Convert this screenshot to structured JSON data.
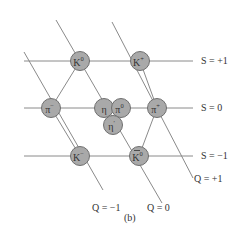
{
  "figure": {
    "caption": "(b)",
    "colors": {
      "line": "#8a8a8a",
      "node_fill": "#a9a9a9",
      "node_stroke": "#6f6f6f",
      "text": "#333333"
    }
  },
  "strangeness_lines": [
    {
      "label": "S = +1",
      "y": 61,
      "x1": 24,
      "x2": 193
    },
    {
      "label": "S = 0",
      "y": 108,
      "x1": 24,
      "x2": 193
    },
    {
      "label": "S = −1",
      "y": 156,
      "x1": 24,
      "x2": 193
    }
  ],
  "charge_lines": [
    {
      "label": "Q = −1",
      "x1": 24,
      "y1": 52,
      "x2": 103,
      "y2": 190
    },
    {
      "label": "Q = 0",
      "x1": 56,
      "y1": 20,
      "x2": 162,
      "y2": 203
    },
    {
      "label": "Q = +1",
      "x1": 112,
      "y1": 22,
      "x2": 193,
      "y2": 178
    }
  ],
  "edges": [
    {
      "x1": 80,
      "y1": 61,
      "x2": 51,
      "y2": 108
    },
    {
      "x1": 140,
      "y1": 61,
      "x2": 157,
      "y2": 108
    },
    {
      "x1": 51,
      "y1": 108,
      "x2": 80,
      "y2": 156
    },
    {
      "x1": 157,
      "y1": 108,
      "x2": 139,
      "y2": 156
    }
  ],
  "particles": [
    {
      "symbol": "K",
      "sup": "0",
      "overbar": false,
      "x": 80,
      "y": 61
    },
    {
      "symbol": "K",
      "sup": "+",
      "overbar": false,
      "x": 140,
      "y": 61
    },
    {
      "symbol": "π",
      "sup": "−",
      "overbar": false,
      "x": 51,
      "y": 108
    },
    {
      "symbol": "η",
      "sup": "",
      "overbar": false,
      "x": 104,
      "y": 108
    },
    {
      "symbol": "π",
      "sup": "0",
      "overbar": false,
      "x": 121,
      "y": 108
    },
    {
      "symbol": "π",
      "sup": "+",
      "overbar": false,
      "x": 157,
      "y": 108
    },
    {
      "symbol": "η",
      "sup": "′",
      "overbar": false,
      "x": 113,
      "y": 125
    },
    {
      "symbol": "K",
      "sup": "−",
      "overbar": false,
      "x": 80,
      "y": 156
    },
    {
      "symbol": "K",
      "sup": "0",
      "overbar": true,
      "x": 139,
      "y": 156
    }
  ],
  "labels": {
    "s_plus_1": {
      "text": "S = +1",
      "x": 201,
      "y": 64
    },
    "s_zero": {
      "text": "S = 0",
      "x": 201,
      "y": 111
    },
    "s_minus_1": {
      "text": "S = −1",
      "x": 201,
      "y": 159
    },
    "q_plus_1": {
      "text": "Q = +1",
      "x": 194,
      "y": 182
    },
    "q_zero": {
      "text": "Q = 0",
      "x": 147,
      "y": 211
    },
    "q_minus_1": {
      "text": "Q = −1",
      "x": 92,
      "y": 211
    },
    "caption": {
      "text": "(b)",
      "x": 124,
      "y": 221
    }
  }
}
